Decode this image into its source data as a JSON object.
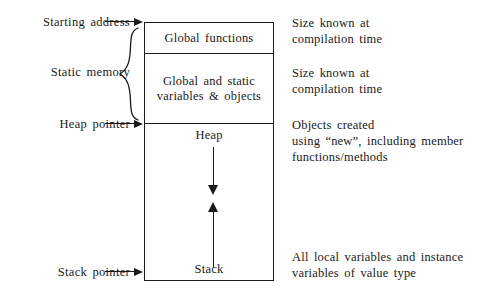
{
  "diagram": {
    "pointers": [
      {
        "id": "starting-address",
        "label": "Starting address"
      },
      {
        "id": "static-memory",
        "label": "Static memory"
      },
      {
        "id": "heap-pointer",
        "label": "Heap pointer"
      },
      {
        "id": "stack-pointer",
        "label": "Stack pointer"
      }
    ],
    "regions": [
      {
        "id": "global-functions",
        "label": "Global functions"
      },
      {
        "id": "static-vars",
        "label": "Global and static\nvariables & objects"
      },
      {
        "id": "heap",
        "label": "Heap"
      },
      {
        "id": "stack",
        "label": "Stack"
      }
    ],
    "annotations": [
      {
        "id": "global-functions",
        "text": "Size known at\ncompilation time"
      },
      {
        "id": "static-vars",
        "text": "Size known at\ncompilation time"
      },
      {
        "id": "heap",
        "text": "Objects created\nusing “new”, including member\nfunctions/methods"
      },
      {
        "id": "stack",
        "text": "All local variables and instance\nvariables of value type"
      }
    ],
    "growth_arrows": [
      {
        "id": "heap-grows-down",
        "direction": "down"
      },
      {
        "id": "stack-grows-up",
        "direction": "up"
      }
    ],
    "colors": {
      "ink": "#1a1a1a",
      "background": "#ffffff"
    }
  }
}
